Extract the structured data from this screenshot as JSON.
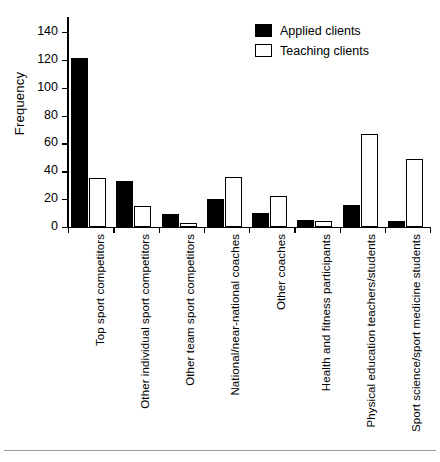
{
  "chart_data": {
    "type": "bar",
    "title": "",
    "xlabel": "",
    "ylabel": "Frequency",
    "ylim": [
      0,
      150
    ],
    "yticks": [
      0,
      20,
      40,
      60,
      80,
      100,
      120,
      140
    ],
    "ytick_labels": [
      "0",
      "20",
      "40",
      "60",
      "80",
      "100",
      "120",
      "140"
    ],
    "grid": false,
    "legend_position": "top-right",
    "categories": [
      "Top sport competitors",
      "Other individual sport competitors",
      "Other team sport competitors",
      "National/near-national coaches",
      "Other coaches",
      "Health and fitness participants",
      "Physical education teachers/students",
      "Sport science/sport medicine students"
    ],
    "series": [
      {
        "name": "Applied clients",
        "color": "#000000",
        "values": [
          121,
          33,
          9,
          20,
          10,
          5,
          16,
          4
        ]
      },
      {
        "name": "Teaching clients",
        "color": "#ffffff",
        "values": [
          35,
          15,
          3,
          36,
          22,
          4,
          67,
          49
        ]
      }
    ]
  },
  "legend": {
    "items": [
      {
        "label": "Applied clients",
        "swatch": "filled-black-square"
      },
      {
        "label": "Teaching clients",
        "swatch": "open-white-square"
      }
    ]
  }
}
